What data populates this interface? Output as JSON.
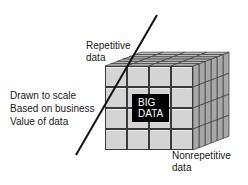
{
  "diagram": {
    "center_label": {
      "line1": "BIG",
      "line2": "DATA"
    },
    "labels": {
      "repetitive": {
        "line1": "Repetitive",
        "line2": "data"
      },
      "nonrepetitive": {
        "line1": "Nonrepetitive",
        "line2": "data"
      },
      "scale_note": {
        "line1": "Drawn to scale",
        "line2": "Based on business",
        "line3": "Value of data"
      }
    },
    "cube": {
      "rows": 4,
      "cols": 4,
      "depth": 6,
      "face_color": "#d4d4d4",
      "side_color": "#a8a8a8",
      "top_color": "#bdbdbd",
      "edge_color": "#3a3a3a"
    },
    "divider_line": {
      "x1": 76,
      "y1": 155,
      "x2": 157,
      "y2": 15,
      "color": "#111111"
    }
  }
}
